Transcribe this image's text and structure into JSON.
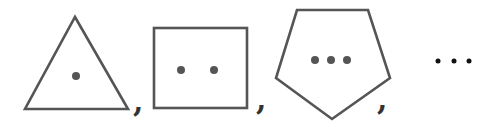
{
  "sequence": {
    "items": [
      {
        "shape": "triangle",
        "sides": 3,
        "dots": 1,
        "separator": ","
      },
      {
        "shape": "square",
        "sides": 4,
        "dots": 2,
        "separator": ","
      },
      {
        "shape": "pentagon",
        "sides": 5,
        "dots": 3,
        "separator": ","
      }
    ],
    "continuation": "…"
  },
  "colors": {
    "stroke": "#555555",
    "dot": "#555555",
    "ellipsis": "#111111"
  }
}
